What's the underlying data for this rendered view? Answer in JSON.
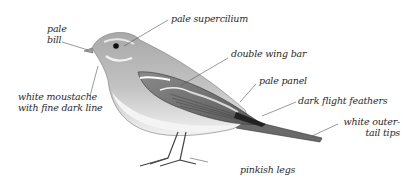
{
  "diagram": {
    "colors": {
      "background": "#ffffff",
      "body": "#b9b9b9",
      "belly": "#ececec",
      "wing": "#7a7a7a",
      "dark": "#2a2a2a",
      "label_text": "#2a2a2a",
      "leader_line": "#555555"
    },
    "labels": {
      "pale_bill": [
        "pale",
        "bill"
      ],
      "pale_supercilium": "pale supercilium",
      "double_wing_bar": "double wing bar",
      "pale_panel": "pale panel",
      "dark_flight_feathers": "dark flight feathers",
      "white_outer_tail_tips": [
        "white outer-",
        "tail tips"
      ],
      "white_moustache": [
        "white moustache",
        "with fine dark line"
      ],
      "pinkish_legs": "pinkish legs"
    }
  }
}
